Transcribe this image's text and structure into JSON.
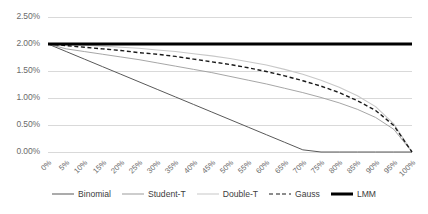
{
  "chart_data": {
    "type": "line",
    "title": "",
    "xlabel": "",
    "ylabel": "",
    "grid": true,
    "legend_position": "bottom",
    "ylim": [
      0.0,
      0.025
    ],
    "ytick_labels": [
      "2.50%",
      "2.00%",
      "1.50%",
      "1.00%",
      "0.50%",
      "0.00%"
    ],
    "ytick_values": [
      0.025,
      0.02,
      0.015,
      0.01,
      0.005,
      0.0
    ],
    "categories": [
      "0%",
      "5%",
      "10%",
      "15%",
      "20%",
      "25%",
      "30%",
      "35%",
      "40%",
      "45%",
      "50%",
      "55%",
      "60%",
      "65%",
      "70%",
      "75%",
      "80%",
      "85%",
      "90%",
      "95%",
      "100%"
    ],
    "x": [
      0,
      5,
      10,
      15,
      20,
      25,
      30,
      35,
      40,
      45,
      50,
      55,
      60,
      65,
      70,
      75,
      80,
      85,
      90,
      95,
      100
    ],
    "series": [
      {
        "name": "Binomial",
        "color": "#595959",
        "width": 1.0,
        "dash": "none",
        "values": [
          0.02,
          0.0186,
          0.0172,
          0.0158,
          0.0144,
          0.013,
          0.0116,
          0.0102,
          0.0088,
          0.0074,
          0.006,
          0.0046,
          0.0032,
          0.0018,
          0.0004,
          0.0,
          0.0,
          0.0,
          0.0,
          0.0,
          0.0
        ]
      },
      {
        "name": "Student-T",
        "color": "#9c9c9c",
        "width": 0.9,
        "dash": "none",
        "values": [
          0.02,
          0.0191,
          0.0186,
          0.0181,
          0.0176,
          0.0171,
          0.0165,
          0.0159,
          0.0153,
          0.0147,
          0.014,
          0.0133,
          0.0126,
          0.0118,
          0.011,
          0.0101,
          0.0091,
          0.0079,
          0.0064,
          0.0042,
          0.0
        ]
      },
      {
        "name": "Double-T",
        "color": "#c8c8c8",
        "width": 1.1,
        "dash": "none",
        "values": [
          0.02,
          0.0199,
          0.0198,
          0.0196,
          0.0194,
          0.0192,
          0.0189,
          0.0186,
          0.0182,
          0.0178,
          0.0173,
          0.0167,
          0.0161,
          0.0153,
          0.0144,
          0.0133,
          0.012,
          0.0104,
          0.0084,
          0.0052,
          0.0
        ]
      },
      {
        "name": "Gauss",
        "color": "#1a1a1a",
        "width": 1.4,
        "dash": "4,2.6",
        "values": [
          0.02,
          0.0197,
          0.0194,
          0.0191,
          0.0188,
          0.0184,
          0.0181,
          0.0177,
          0.0172,
          0.0167,
          0.0162,
          0.0156,
          0.0149,
          0.0141,
          0.0132,
          0.0122,
          0.011,
          0.0095,
          0.0077,
          0.0049,
          0.0
        ]
      },
      {
        "name": "LMM",
        "color": "#000000",
        "width": 3.2,
        "dash": "none",
        "values": [
          0.02,
          0.02,
          0.02,
          0.02,
          0.02,
          0.02,
          0.02,
          0.02,
          0.02,
          0.02,
          0.02,
          0.02,
          0.02,
          0.02,
          0.02,
          0.02,
          0.02,
          0.02,
          0.02,
          0.02,
          0.02
        ]
      }
    ],
    "gridline_color": "#d9d9d9",
    "axis_text_color": "#6b6b6b"
  }
}
